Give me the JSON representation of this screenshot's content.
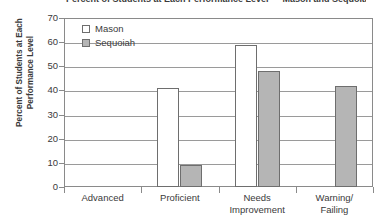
{
  "chart_data": {
    "type": "bar",
    "title": "Percent of Students at Each Performance Level — Mason and Sequoiah Schools",
    "xlabel": "",
    "ylabel": "Percent of Students at Each Performance Level",
    "ylabel_line1": "Percent of Students at Each",
    "ylabel_line2": "Performance Level",
    "categories": [
      "Advanced",
      "Proficient",
      "Needs Improvement",
      "Warning/ Failing"
    ],
    "category_lines": [
      [
        "Advanced"
      ],
      [
        "Proficient"
      ],
      [
        "Needs",
        "Improvement"
      ],
      [
        "Warning/",
        "Failing"
      ]
    ],
    "series": [
      {
        "name": "Mason",
        "values": [
          0,
          41,
          59,
          0
        ],
        "color": "#ffffff",
        "border": "#6e6e6e"
      },
      {
        "name": "Sequoiah",
        "values": [
          0,
          9,
          48,
          42
        ],
        "color": "#b5b5b5",
        "border": "#6e6e6e"
      }
    ],
    "ylim": [
      0,
      70
    ],
    "yticks": [
      0,
      10,
      20,
      30,
      40,
      50,
      60,
      70
    ],
    "ytick_labels": [
      "0",
      "10",
      "20",
      "30",
      "40",
      "50",
      "60",
      "70"
    ],
    "grid": true,
    "legend_position": "top-left-inside",
    "legend": [
      "Mason",
      "Sequoiah"
    ]
  },
  "axis": {
    "line_color": "#8a8a8a",
    "grid_color": "#9a9a9a"
  }
}
